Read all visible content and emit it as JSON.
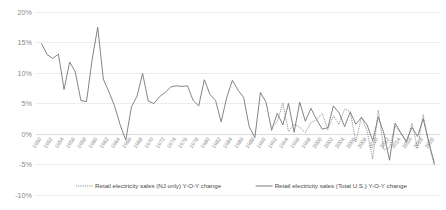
{
  "chart_data": {
    "type": "line",
    "title": "",
    "xlabel": "",
    "ylabel": "",
    "ylim": [
      -10,
      20
    ],
    "xlim": [
      1949,
      2021
    ],
    "grid": true,
    "legend_position": "bottom",
    "ytick_labels": [
      "20%",
      "15%",
      "10%",
      "5%",
      "0%",
      "-5%",
      "-10%"
    ],
    "ytick_values": [
      20,
      15,
      10,
      5,
      0,
      -5,
      -10
    ],
    "xtick_labels": [
      "1950",
      "1952",
      "1954",
      "1956",
      "1958",
      "1960",
      "1962",
      "1964",
      "1966",
      "1968",
      "1970",
      "1972",
      "1974",
      "1976",
      "1978",
      "1980",
      "1982",
      "1984",
      "1986",
      "1988",
      "1990",
      "1992",
      "1994",
      "1996",
      "1998",
      "2000",
      "2002",
      "2004",
      "2006",
      "2008",
      "2010",
      "2012",
      "2014",
      "2016",
      "2018",
      "2020"
    ],
    "xtick_values": [
      1950,
      1952,
      1954,
      1956,
      1958,
      1960,
      1962,
      1964,
      1966,
      1968,
      1970,
      1972,
      1974,
      1976,
      1978,
      1980,
      1982,
      1984,
      1986,
      1988,
      1990,
      1992,
      1994,
      1996,
      1998,
      2000,
      2002,
      2004,
      2006,
      2008,
      2010,
      2012,
      2014,
      2016,
      2018,
      2020
    ],
    "series": [
      {
        "name": "Retail electricity sales (NJ only) Y-O-Y change",
        "style": "dashed",
        "color": "#7a7a7a",
        "x": [
          1991,
          1992,
          1993,
          1994,
          1995,
          1996,
          1997,
          1998,
          1999,
          2000,
          2001,
          2002,
          2003,
          2004,
          2005,
          2006,
          2007,
          2008,
          2009,
          2010,
          2011,
          2012,
          2013,
          2014,
          2015,
          2016,
          2017,
          2018,
          2019,
          2020
        ],
        "values": [
          1.2,
          2.0,
          5.1,
          0.4,
          1.6,
          1.1,
          0.2,
          1.9,
          2.3,
          3.4,
          0.7,
          3.0,
          1.6,
          4.1,
          3.7,
          -1.3,
          2.8,
          0.5,
          -4.1,
          3.9,
          -2.6,
          -2.2,
          1.3,
          0.2,
          -1.5,
          1.8,
          -2.4,
          3.2,
          -1.6,
          -5.2
        ]
      },
      {
        "name": "Retail electricity sales (Total U.S.) Y-O-Y change",
        "style": "solid",
        "color": "#6e6e6e",
        "x": [
          1950,
          1951,
          1952,
          1953,
          1954,
          1955,
          1956,
          1957,
          1958,
          1959,
          1960,
          1961,
          1962,
          1963,
          1964,
          1965,
          1966,
          1967,
          1968,
          1969,
          1970,
          1971,
          1972,
          1973,
          1974,
          1975,
          1976,
          1977,
          1978,
          1979,
          1980,
          1981,
          1982,
          1983,
          1984,
          1985,
          1986,
          1987,
          1988,
          1989,
          1990,
          1991,
          1992,
          1993,
          1994,
          1995,
          1996,
          1997,
          1998,
          1999,
          2000,
          2001,
          2002,
          2003,
          2004,
          2005,
          2006,
          2007,
          2008,
          2009,
          2010,
          2011,
          2012,
          2013,
          2014,
          2015,
          2016,
          2017,
          2018,
          2019,
          2020
        ],
        "values": [
          14.8,
          13.0,
          12.4,
          13.1,
          7.3,
          11.8,
          10.2,
          5.5,
          5.3,
          12.2,
          17.5,
          9.0,
          6.9,
          4.6,
          1.5,
          -1.0,
          4.4,
          6.2,
          9.9,
          5.4,
          5.0,
          6.1,
          6.8,
          7.7,
          7.9,
          7.8,
          7.9,
          5.5,
          4.6,
          8.9,
          6.5,
          5.5,
          2.0,
          6.0,
          8.8,
          7.2,
          6.0,
          1.2,
          -0.6,
          6.8,
          5.2,
          0.6,
          3.4,
          1.5,
          5.0,
          0.3,
          5.2,
          2.1,
          4.2,
          2.4,
          0.8,
          1.0,
          4.6,
          3.5,
          1.2,
          3.6,
          1.6,
          2.7,
          1.5,
          -1.1,
          2.8,
          0.1,
          -4.3,
          1.8,
          0.2,
          -1.2,
          1.1,
          -0.4,
          2.5,
          -1.3,
          -4.8
        ]
      }
    ]
  },
  "legend": {
    "items": [
      {
        "label": "Retail electricity sales (NJ only) Y-O-Y change",
        "marker": "dashed-line-swatch"
      },
      {
        "label": "Retail electricity sales (Total U.S.) Y-O-Y change",
        "marker": "solid-line-swatch"
      }
    ]
  }
}
